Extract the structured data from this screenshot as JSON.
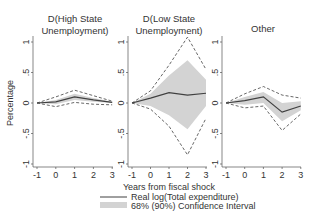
{
  "chart_data": {
    "type": "line",
    "ylabel": "Percentage",
    "xlabel": "Years from fiscal shock",
    "x": [
      -1,
      0,
      1,
      2,
      3
    ],
    "xticks": [
      "-1",
      "0",
      "1",
      "2",
      "3"
    ],
    "yticks": [
      "-1",
      "-.5",
      "0",
      ".5",
      "1"
    ],
    "ylim": [
      -1.05,
      1.2
    ],
    "grid": false,
    "legend": {
      "position": "bottom-right",
      "entries": [
        "Real log(Total expenditure)",
        "68% (90%) Confidence Interval"
      ]
    },
    "panels": [
      {
        "title_line1": "D(High State",
        "title_line2": "Unemployment)",
        "series": [
          {
            "name": "Real log(Total expenditure)",
            "values": [
              0,
              0.02,
              0.1,
              0.05,
              0.01
            ]
          },
          {
            "name": "68% CI upper",
            "values": [
              0,
              0.05,
              0.15,
              0.08,
              0.02
            ]
          },
          {
            "name": "68% CI lower",
            "values": [
              0,
              -0.02,
              0.05,
              0.02,
              0.0
            ]
          },
          {
            "name": "90% CI upper",
            "values": [
              0,
              0.1,
              0.21,
              0.12,
              0.03
            ]
          },
          {
            "name": "90% CI lower",
            "values": [
              0,
              -0.06,
              0.01,
              -0.02,
              -0.03
            ]
          }
        ]
      },
      {
        "title_line1": "D(Low State",
        "title_line2": "Unemployment)",
        "series": [
          {
            "name": "Real log(Total expenditure)",
            "values": [
              0,
              0.08,
              0.17,
              0.13,
              0.16
            ]
          },
          {
            "name": "68% CI upper",
            "values": [
              0,
              0.15,
              0.45,
              0.7,
              0.38
            ]
          },
          {
            "name": "68% CI lower",
            "values": [
              0,
              -0.05,
              -0.2,
              -0.43,
              -0.05
            ]
          },
          {
            "name": "90% CI upper",
            "values": [
              0,
              0.2,
              0.62,
              1.08,
              0.55
            ]
          },
          {
            "name": "90% CI lower",
            "values": [
              0,
              -0.1,
              -0.38,
              -0.85,
              -0.25
            ]
          }
        ]
      },
      {
        "title_line1": "Other",
        "title_line2": "",
        "series": [
          {
            "name": "Real log(Total expenditure)",
            "values": [
              0,
              0.04,
              0.1,
              -0.15,
              -0.05
            ]
          },
          {
            "name": "68% CI upper",
            "values": [
              0,
              0.1,
              0.18,
              0.0,
              0.03
            ]
          },
          {
            "name": "68% CI lower",
            "values": [
              0,
              -0.03,
              0.0,
              -0.3,
              -0.12
            ]
          },
          {
            "name": "90% CI upper",
            "values": [
              0,
              0.15,
              0.27,
              0.13,
              0.08
            ]
          },
          {
            "name": "90% CI lower",
            "values": [
              0,
              -0.08,
              -0.05,
              -0.45,
              -0.18
            ]
          }
        ]
      }
    ]
  },
  "colors": {
    "line": "#404040",
    "dashed": "#404040",
    "band": "#d3d3d3",
    "axis": "#555555",
    "text": "#333333"
  }
}
